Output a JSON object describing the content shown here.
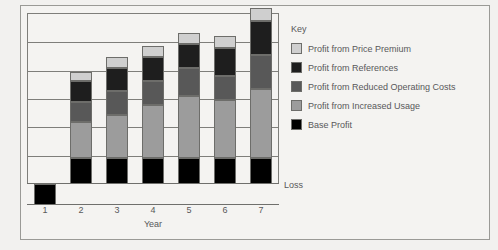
{
  "chart_data": {
    "type": "bar",
    "title": "",
    "xlabel": "Year",
    "ylabel": "",
    "stacked": true,
    "grid": true,
    "legend_position": "right",
    "legend_title": "Key",
    "categories": [
      "1",
      "2",
      "3",
      "4",
      "5",
      "6",
      "7"
    ],
    "annotations": [
      {
        "text": "Loss",
        "note": "label for the below-zero region of the value axis"
      }
    ],
    "series": [
      {
        "name": "Base Profit",
        "color": "#000000",
        "values": [
          -22,
          28,
          28,
          28,
          28,
          28,
          28
        ]
      },
      {
        "name": "Profit from Increased Usage",
        "color": "#9c9c9c",
        "values": [
          0,
          38,
          46,
          56,
          66,
          62,
          74
        ]
      },
      {
        "name": "Profit from Reduced Operating Costs",
        "color": "#585858",
        "values": [
          0,
          22,
          26,
          26,
          30,
          26,
          36
        ]
      },
      {
        "name": "Profit from References",
        "color": "#1e1e1e",
        "values": [
          0,
          22,
          24,
          26,
          26,
          30,
          36
        ]
      },
      {
        "name": "Profit from Price Premium",
        "color": "#cfcfcf",
        "values": [
          0,
          10,
          12,
          12,
          12,
          12,
          14
        ]
      }
    ]
  },
  "axis": {
    "tick_labels": [
      "1",
      "2",
      "3",
      "4",
      "5",
      "6",
      "7"
    ],
    "title": "Year",
    "loss_label": "Loss"
  },
  "legend": {
    "title": "Key",
    "items": [
      {
        "label": "Profit from Price Premium",
        "color": "#cfcfcf"
      },
      {
        "label": "Profit from References",
        "color": "#1e1e1e"
      },
      {
        "label": "Profit from Reduced Operating Costs",
        "color": "#585858"
      },
      {
        "label": "Profit from Increased Usage",
        "color": "#9c9c9c"
      },
      {
        "label": "Base Profit",
        "color": "#000000"
      }
    ]
  }
}
